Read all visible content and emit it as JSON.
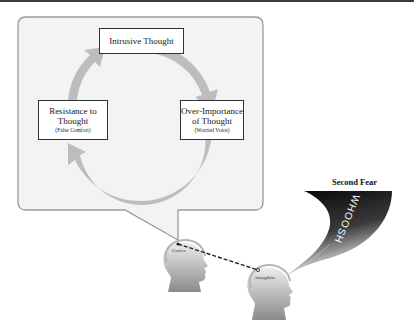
{
  "diagram": {
    "cycle": {
      "nodes": [
        {
          "id": "intrusive",
          "title": "Intrusive Thought",
          "subtitle": ""
        },
        {
          "id": "over_importance",
          "title_line1": "Over-Importance",
          "title_line2": "of Thought",
          "subtitle": "(Worried Voice)"
        },
        {
          "id": "resistance",
          "title_line1": "Resistance to",
          "title_line2": "Thought",
          "subtitle": "(False Comfort)"
        }
      ],
      "direction": "clockwise"
    },
    "heads": [
      {
        "label": "Cortex"
      },
      {
        "label": "Amygdala"
      }
    ],
    "second_fear": {
      "title": "Second Fear",
      "whoosh_text": "WHOOSH"
    },
    "colors": {
      "cycle_arrow": "#bdbdbd",
      "bubble_fill": "#f3f3f3",
      "bubble_border": "#9a9a9a",
      "head_gradient_top": "#e6e6e6",
      "head_gradient_bottom": "#8c8c8c",
      "whoosh_dark": "#111111"
    }
  }
}
